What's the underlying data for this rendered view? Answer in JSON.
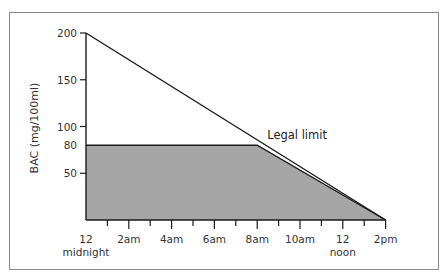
{
  "chart_data": {
    "type": "area",
    "title": "",
    "xlabel": "",
    "ylabel": "BAC (mg/100ml)",
    "ylim": [
      0,
      200
    ],
    "y_ticks": [
      50,
      80,
      100,
      150,
      200
    ],
    "y_tick_labels": [
      "50",
      "80",
      "100",
      "150",
      "200"
    ],
    "x_ticks_hours": [
      0,
      1,
      2,
      3,
      4,
      5,
      6,
      7,
      8,
      9,
      10,
      11,
      12,
      13,
      14
    ],
    "x_tick_labels": [
      {
        "hour": 0,
        "label": "12",
        "sublabel": "midnight"
      },
      {
        "hour": 2,
        "label": "2am",
        "sublabel": ""
      },
      {
        "hour": 4,
        "label": "4am",
        "sublabel": ""
      },
      {
        "hour": 6,
        "label": "6am",
        "sublabel": ""
      },
      {
        "hour": 8,
        "label": "8am",
        "sublabel": ""
      },
      {
        "hour": 10,
        "label": "10am",
        "sublabel": ""
      },
      {
        "hour": 12,
        "label": "12",
        "sublabel": "noon"
      },
      {
        "hour": 14,
        "label": "2pm",
        "sublabel": ""
      }
    ],
    "series": [
      {
        "name": "BAC elimination line",
        "x_hours": [
          0,
          14
        ],
        "values": [
          200,
          0
        ]
      },
      {
        "name": "Legal limit (shaded region)",
        "x_hours": [
          0,
          8,
          14
        ],
        "values": [
          80,
          80,
          0
        ],
        "fill": "#a5a5a5"
      }
    ],
    "annotations": [
      {
        "text": "Legal limit",
        "x_hours": 8,
        "y": 80
      }
    ],
    "legend": "none",
    "grid": false
  },
  "colors": {
    "fill": "#a5a5a5",
    "line": "#1a1a1a",
    "frame": "#8a8a8a",
    "text": "#333333"
  }
}
